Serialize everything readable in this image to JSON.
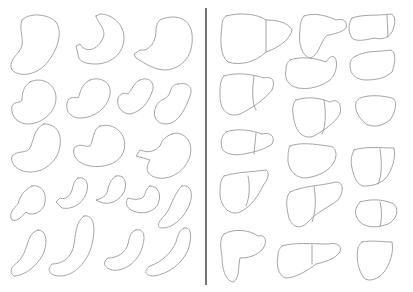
{
  "figure": {
    "background": "#ffffff",
    "stroke_color": "#9a9a9a",
    "divider_color": "#3a3a3a",
    "left_panel": {
      "subject": "stomach outlines",
      "count": 21
    },
    "right_panel": {
      "subject": "liver outlines",
      "count": 15
    }
  }
}
